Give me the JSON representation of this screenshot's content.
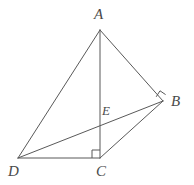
{
  "figure": {
    "kind": "geometry-diagram",
    "background_color": "#ffffff",
    "stroke_color": "#595959",
    "label_color": "#4a4a4a",
    "stroke_width": 1,
    "canvas": {
      "width": 194,
      "height": 185
    }
  },
  "points": {
    "A": {
      "label": "A",
      "x": 100,
      "y": 30
    },
    "B": {
      "label": "B",
      "x": 163,
      "y": 101
    },
    "C": {
      "label": "C",
      "x": 100,
      "y": 158
    },
    "D": {
      "label": "D",
      "x": 18,
      "y": 158
    },
    "E": {
      "label": "E",
      "x": 100,
      "y": 124
    }
  },
  "segments": [
    {
      "name": "AD",
      "from": "A",
      "to": "D"
    },
    {
      "name": "AB",
      "from": "A",
      "to": "B"
    },
    {
      "name": "AC",
      "from": "A",
      "to": "C"
    },
    {
      "name": "DC",
      "from": "D",
      "to": "C"
    },
    {
      "name": "DB",
      "from": "D",
      "to": "B"
    },
    {
      "name": "CB",
      "from": "C",
      "to": "B"
    }
  ],
  "right_angle_marks": [
    {
      "name": "right-angle-at-C",
      "vertex": "C",
      "size": 8
    },
    {
      "name": "right-angle-at-B",
      "vertex": "B",
      "size": 7
    }
  ]
}
